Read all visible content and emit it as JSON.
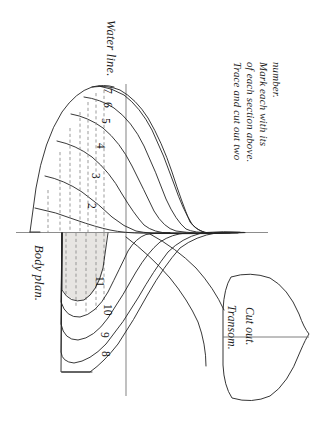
{
  "drawing": {
    "title": "Body plan and transom pattern",
    "type": "naval-architecture-lines-plan",
    "orientation_deg": 90,
    "background_color": "#ffffff",
    "line_color": "#222222",
    "shade_color": "#e3e1dd",
    "axis_color": "#8d8d8d"
  },
  "labels": {
    "water_line": "Water line.",
    "body_plan": "Body plan.",
    "transom": "Transom.",
    "cut_out": "Cut out.",
    "instruction_line_1": "Trace and cut out two",
    "instruction_line_2": "of each section above.",
    "instruction_line_3": "Mark each with its",
    "instruction_line_4": "number."
  },
  "station_numbers": {
    "upper": [
      "2",
      "3",
      "4",
      "5",
      "6",
      "7"
    ],
    "lower": [
      "8",
      "9",
      "10",
      "11"
    ]
  },
  "numbers": [
    {
      "id": "n2",
      "text": "2"
    },
    {
      "id": "n3",
      "text": "3"
    },
    {
      "id": "n4",
      "text": "4"
    },
    {
      "id": "n5",
      "text": "5"
    },
    {
      "id": "n6",
      "text": "6"
    },
    {
      "id": "n7",
      "text": "7"
    },
    {
      "id": "n8",
      "text": "8"
    },
    {
      "id": "n9",
      "text": "9"
    },
    {
      "id": "n10",
      "text": "10"
    },
    {
      "id": "n11",
      "text": "11"
    }
  ]
}
